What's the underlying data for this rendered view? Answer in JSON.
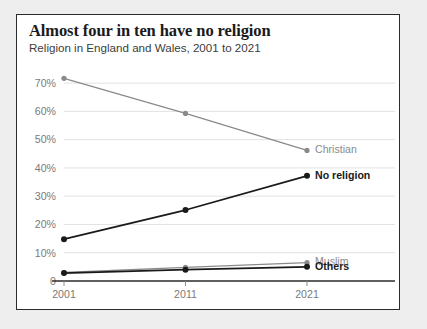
{
  "card": {
    "background_color": "#ffffff",
    "border_color": "#2b2b2b"
  },
  "page": {
    "background_color": "#eeeeee"
  },
  "chart_data": {
    "type": "line",
    "title": "Almost four in ten have no religion",
    "subtitle": "Religion in England and Wales, 2001 to 2021",
    "xlabel": "",
    "ylabel": "",
    "x": [
      2001,
      2011,
      2021
    ],
    "categories": [
      "2001",
      "2011",
      "2021"
    ],
    "xtick_labels": [
      "2001",
      "2011",
      "2021"
    ],
    "ytick_labels": [
      "0",
      "10%",
      "20%",
      "30%",
      "40%",
      "50%",
      "60%",
      "70%"
    ],
    "ytick_values": [
      0,
      10,
      20,
      30,
      40,
      50,
      60,
      70
    ],
    "ylim": [
      0,
      75
    ],
    "grid": true,
    "grid_color": "#e2e2e2",
    "legend_position": "right-inline",
    "series": [
      {
        "name": "Christian",
        "label": "Christian",
        "values": [
          71.7,
          59.3,
          46.2
        ],
        "color": "#8a8a8a",
        "label_style": "muted",
        "line_width": 1.3,
        "marker_size": 2.6
      },
      {
        "name": "No religion",
        "label": "No religion",
        "values": [
          14.8,
          25.1,
          37.2
        ],
        "color": "#1a1a1a",
        "label_style": "strong",
        "line_width": 1.7,
        "marker_size": 3.0
      },
      {
        "name": "Muslim",
        "label": "Muslim",
        "values": [
          3.0,
          4.8,
          6.5
        ],
        "color": "#8a8a8a",
        "label_style": "muted",
        "line_width": 1.3,
        "marker_size": 2.6
      },
      {
        "name": "Others",
        "label": "Others",
        "values": [
          2.8,
          4.0,
          5.0
        ],
        "color": "#1a1a1a",
        "label_style": "strong",
        "line_width": 1.7,
        "marker_size": 3.0
      }
    ]
  }
}
